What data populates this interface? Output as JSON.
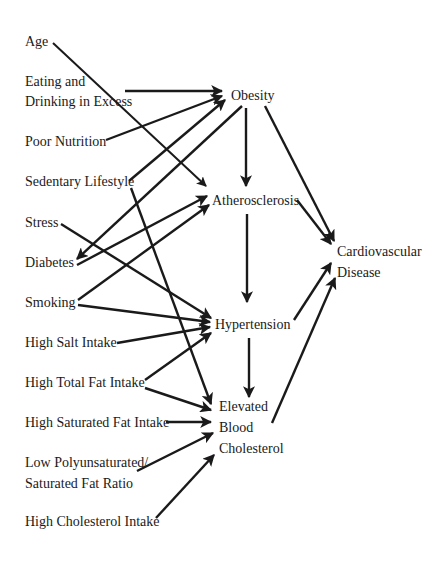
{
  "diagram": {
    "type": "causal-diagram",
    "risk_factors": [
      {
        "id": "age",
        "lines": [
          "Age"
        ]
      },
      {
        "id": "eating",
        "lines": [
          "Eating and",
          "Drinking in Excess"
        ]
      },
      {
        "id": "poor_nutrition",
        "lines": [
          "Poor Nutrition"
        ]
      },
      {
        "id": "sedentary",
        "lines": [
          "Sedentary Lifestyle"
        ]
      },
      {
        "id": "stress",
        "lines": [
          "Stress"
        ]
      },
      {
        "id": "diabetes",
        "lines": [
          "Diabetes"
        ]
      },
      {
        "id": "smoking",
        "lines": [
          "Smoking"
        ]
      },
      {
        "id": "high_salt",
        "lines": [
          "High Salt Intake"
        ]
      },
      {
        "id": "high_total_fat",
        "lines": [
          "High Total Fat Intake"
        ]
      },
      {
        "id": "high_sat_fat",
        "lines": [
          "High Saturated Fat Intake"
        ]
      },
      {
        "id": "low_poly",
        "lines": [
          "Low Polyunsaturated/",
          "Saturated Fat Ratio"
        ]
      },
      {
        "id": "high_chol",
        "lines": [
          "High Cholesterol Intake"
        ]
      }
    ],
    "intermediate": [
      {
        "id": "obesity",
        "lines": [
          "Obesity"
        ]
      },
      {
        "id": "atherosclerosis",
        "lines": [
          "Atherosclerosis"
        ]
      },
      {
        "id": "hypertension",
        "lines": [
          "Hypertension"
        ]
      },
      {
        "id": "elevated_chol",
        "lines": [
          "Elevated",
          "Blood",
          "Cholesterol"
        ]
      }
    ],
    "outcome": {
      "id": "cvd",
      "lines": [
        "Cardiovascular",
        "Disease"
      ]
    },
    "edges": [
      [
        "age",
        "atherosclerosis"
      ],
      [
        "eating",
        "obesity"
      ],
      [
        "poor_nutrition",
        "obesity"
      ],
      [
        "sedentary",
        "obesity"
      ],
      [
        "sedentary",
        "elevated_chol"
      ],
      [
        "obesity",
        "diabetes"
      ],
      [
        "obesity",
        "atherosclerosis"
      ],
      [
        "obesity",
        "cvd"
      ],
      [
        "stress",
        "hypertension"
      ],
      [
        "diabetes",
        "atherosclerosis"
      ],
      [
        "smoking",
        "atherosclerosis"
      ],
      [
        "smoking",
        "hypertension"
      ],
      [
        "high_salt",
        "hypertension"
      ],
      [
        "high_total_fat",
        "hypertension"
      ],
      [
        "high_total_fat",
        "elevated_chol"
      ],
      [
        "high_sat_fat",
        "elevated_chol"
      ],
      [
        "low_poly",
        "elevated_chol"
      ],
      [
        "high_chol",
        "elevated_chol"
      ],
      [
        "atherosclerosis",
        "hypertension"
      ],
      [
        "atherosclerosis",
        "cvd"
      ],
      [
        "hypertension",
        "elevated_chol"
      ],
      [
        "hypertension",
        "cvd"
      ],
      [
        "elevated_chol",
        "cvd"
      ]
    ]
  }
}
